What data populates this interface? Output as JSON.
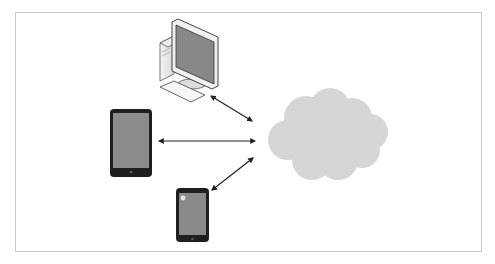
{
  "diagram": {
    "type": "cloud-connectivity",
    "nodes": [
      {
        "id": "desktop",
        "label": "desktop-computer",
        "kind": "desktop"
      },
      {
        "id": "tablet",
        "label": "tablet",
        "kind": "tablet"
      },
      {
        "id": "smartphone",
        "label": "smartphone",
        "kind": "smartphone"
      },
      {
        "id": "cloud",
        "label": "cloud",
        "kind": "cloud"
      }
    ],
    "edges": [
      {
        "from": "desktop",
        "to": "cloud",
        "direction": "bidirectional"
      },
      {
        "from": "tablet",
        "to": "cloud",
        "direction": "bidirectional"
      },
      {
        "from": "smartphone",
        "to": "cloud",
        "direction": "bidirectional"
      }
    ],
    "colors": {
      "frame_border": "#c8c8c8",
      "screen": "#8a8a8a",
      "device_body": "#222222",
      "cloud": "#d6d6d6",
      "arrow": "#222222"
    }
  }
}
